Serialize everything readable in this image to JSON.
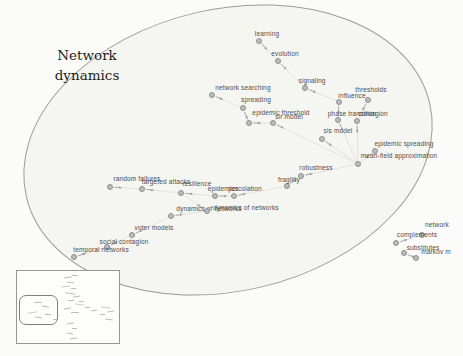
{
  "title": {
    "line1": "Network",
    "line2": "dynamics"
  },
  "colors": {
    "background": "#fbfbf9",
    "ellipse_fill": "#f5f5f1",
    "ellipse_stroke": "#9a9a9a",
    "node_fill": "#bcbcbc",
    "node_stroke": "#8f8f8f",
    "edge": "#dcdcdc",
    "arrow": "#a3a3a3",
    "label_text": "#4d4d4d"
  },
  "graph": {
    "ellipse": {
      "cx": 228,
      "cy": 150,
      "rx": 207,
      "ry": 141,
      "rotate": -13
    },
    "nodes": [
      {
        "id": "learning",
        "label": "learning",
        "nx": 259,
        "ny": 41,
        "lx": 267,
        "ly": 33
      },
      {
        "id": "evolution",
        "label": "evolution",
        "nx": 278,
        "ny": 61,
        "lx": 285,
        "ly": 53
      },
      {
        "id": "signaling",
        "label": "signaling",
        "nx": 305,
        "ny": 88,
        "lx": 312,
        "ly": 80
      },
      {
        "id": "influence",
        "label": "influence",
        "nx": 339,
        "ny": 102,
        "lx": 352,
        "ly": 95
      },
      {
        "id": "thresholds",
        "label": "thresholds",
        "nx": 368,
        "ny": 100,
        "lx": 371,
        "ly": 89
      },
      {
        "id": "phase-transition",
        "label": "phase transition",
        "nx": 338,
        "ny": 120,
        "lx": 352,
        "ly": 113
      },
      {
        "id": "contagion",
        "label": "contagion",
        "nx": 357,
        "ny": 121,
        "lx": 373,
        "ly": 113
      },
      {
        "id": "network-searching",
        "label": "network searching",
        "nx": 212,
        "ny": 95,
        "lx": 243,
        "ly": 87
      },
      {
        "id": "spreading",
        "label": "spreading",
        "nx": 243,
        "ny": 108,
        "lx": 256,
        "ly": 99
      },
      {
        "id": "epidemic-threshold",
        "label": "epidemic threshold",
        "nx": 249,
        "ny": 123,
        "lx": 281,
        "ly": 112
      },
      {
        "id": "sir-model",
        "label": "sir model",
        "nx": 273,
        "ny": 123,
        "lx": 289,
        "ly": 116
      },
      {
        "id": "sis-model",
        "label": "sis model",
        "nx": 322,
        "ny": 139,
        "lx": 338,
        "ly": 130
      },
      {
        "id": "epidemic-spreading",
        "label": "epidemic spreading",
        "nx": 375,
        "ny": 151,
        "lx": 404,
        "ly": 143
      },
      {
        "id": "mean-field-approximation",
        "label": "mean-field approximation",
        "nx": 358,
        "ny": 164,
        "lx": 399,
        "ly": 155
      },
      {
        "id": "robustness",
        "label": "robustness",
        "nx": 301,
        "ny": 176,
        "lx": 316,
        "ly": 167
      },
      {
        "id": "fragility",
        "label": "fragility",
        "nx": 287,
        "ny": 186,
        "lx": 289,
        "ly": 179
      },
      {
        "id": "random-failures",
        "label": "random failures",
        "nx": 110,
        "ny": 187,
        "lx": 137,
        "ly": 178
      },
      {
        "id": "targeted-attacks",
        "label": "targeted attacks",
        "nx": 142,
        "ny": 189,
        "lx": 166,
        "ly": 181
      },
      {
        "id": "resilience",
        "label": "resilience",
        "nx": 181,
        "ny": 193,
        "lx": 197,
        "ly": 183
      },
      {
        "id": "epidemics",
        "label": "epidemics",
        "nx": 215,
        "ny": 196,
        "lx": 223,
        "ly": 188
      },
      {
        "id": "percolation",
        "label": "percolation",
        "nx": 234,
        "ny": 196,
        "lx": 245,
        "ly": 188
      },
      {
        "id": "dynamics-of-networks-1",
        "label": "dynamics of networks",
        "nx": 171,
        "ny": 216,
        "lx": 209,
        "ly": 208
      },
      {
        "id": "dynamics-of-networks-2",
        "label": "dynamics of networks",
        "nx": 207,
        "ny": 211,
        "lx": 246,
        "ly": 207
      },
      {
        "id": "voter-models",
        "label": "voter models",
        "nx": 132,
        "ny": 235,
        "lx": 154,
        "ly": 227
      },
      {
        "id": "social-contagion",
        "label": "social contagion",
        "nx": 107,
        "ny": 247,
        "lx": 124,
        "ly": 241
      },
      {
        "id": "temporal-networks",
        "label": "temporal networks",
        "nx": 74,
        "ny": 257,
        "lx": 101,
        "ly": 249
      },
      {
        "id": "network",
        "label": "network",
        "nx": 422,
        "ny": 235,
        "lx": 437,
        "ly": 224
      },
      {
        "id": "complements",
        "label": "complements",
        "nx": 396,
        "ny": 243,
        "lx": 417,
        "ly": 234
      },
      {
        "id": "substitutes",
        "label": "substitutes",
        "nx": 404,
        "ny": 253,
        "lx": 423,
        "ly": 247
      },
      {
        "id": "markov-m",
        "label": "markov m",
        "nx": 416,
        "ny": 258,
        "lx": 436,
        "ly": 251
      }
    ],
    "edges": [
      [
        "learning",
        "evolution"
      ],
      [
        "evolution",
        "signaling"
      ],
      [
        "signaling",
        "influence"
      ],
      [
        "influence",
        "phase-transition"
      ],
      [
        "thresholds",
        "contagion"
      ],
      [
        "phase-transition",
        "mean-field-approximation"
      ],
      [
        "contagion",
        "mean-field-approximation"
      ],
      [
        "network-searching",
        "spreading"
      ],
      [
        "spreading",
        "epidemic-threshold"
      ],
      [
        "epidemic-threshold",
        "sir-model"
      ],
      [
        "sir-model",
        "mean-field-approximation"
      ],
      [
        "sis-model",
        "mean-field-approximation"
      ],
      [
        "epidemic-spreading",
        "mean-field-approximation"
      ],
      [
        "robustness",
        "mean-field-approximation"
      ],
      [
        "fragility",
        "robustness"
      ],
      [
        "percolation",
        "fragility"
      ],
      [
        "random-failures",
        "targeted-attacks"
      ],
      [
        "targeted-attacks",
        "resilience"
      ],
      [
        "resilience",
        "epidemics"
      ],
      [
        "epidemics",
        "percolation"
      ],
      [
        "temporal-networks",
        "social-contagion"
      ],
      [
        "social-contagion",
        "voter-models"
      ],
      [
        "voter-models",
        "dynamics-of-networks-1"
      ],
      [
        "dynamics-of-networks-1",
        "dynamics-of-networks-2"
      ],
      [
        "dynamics-of-networks-2",
        "resilience"
      ],
      [
        "complements",
        "network"
      ],
      [
        "substitutes",
        "markov-m"
      ]
    ]
  },
  "inset": {
    "x": 16,
    "y": 270,
    "w": 102,
    "h": 72,
    "zoom_rect": {
      "x": 18,
      "y": 294,
      "w": 37,
      "h": 28
    },
    "marks": [
      [
        63,
        276,
        8
      ],
      [
        71,
        274,
        6
      ],
      [
        66,
        281,
        7
      ],
      [
        60,
        285,
        9
      ],
      [
        70,
        287,
        5
      ],
      [
        64,
        292,
        10
      ],
      [
        72,
        295,
        7
      ],
      [
        67,
        299,
        6
      ],
      [
        74,
        303,
        9
      ],
      [
        63,
        307,
        7
      ],
      [
        70,
        311,
        8
      ],
      [
        100,
        306,
        9
      ],
      [
        106,
        310,
        7
      ],
      [
        99,
        313,
        5
      ],
      [
        104,
        318,
        8
      ],
      [
        66,
        322,
        7
      ],
      [
        71,
        327,
        5
      ],
      [
        66,
        332,
        6
      ],
      [
        69,
        337,
        7
      ],
      [
        33,
        301,
        8
      ],
      [
        41,
        305,
        7
      ],
      [
        27,
        311,
        9
      ],
      [
        44,
        313,
        6
      ],
      [
        34,
        316,
        7
      ],
      [
        90,
        309,
        6
      ],
      [
        84,
        306,
        5
      ],
      [
        52,
        318,
        4
      ],
      [
        78,
        300,
        5
      ]
    ]
  }
}
